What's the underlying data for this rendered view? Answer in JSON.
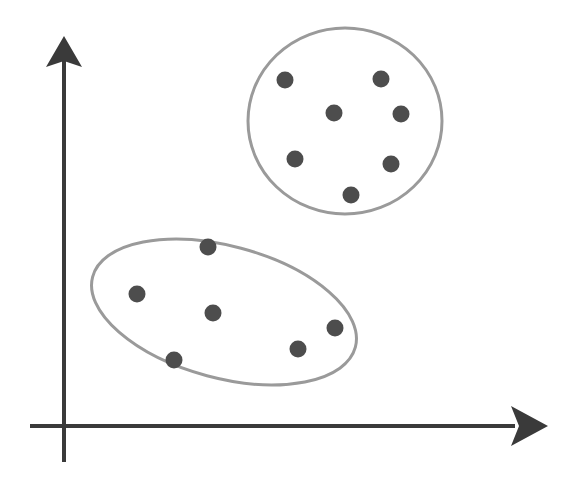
{
  "diagram": {
    "type": "clustering-illustration",
    "colors": {
      "axis": "#3a3a3a",
      "cluster_outline": "#9a9a9a",
      "point": "#4d4d4d",
      "background": "#ffffff"
    },
    "axes": {
      "origin": [
        64,
        426
      ],
      "x_end": [
        522,
        426
      ],
      "y_end": [
        64,
        36
      ]
    },
    "clusters": [
      {
        "name": "upper-right-cluster",
        "shape": "circle",
        "center": [
          345,
          121
        ],
        "rx": 97,
        "ry": 93,
        "rotation": 0,
        "points": [
          [
            285,
            80
          ],
          [
            381,
            79
          ],
          [
            334,
            113
          ],
          [
            401,
            114
          ],
          [
            295,
            159
          ],
          [
            391,
            164
          ],
          [
            351,
            195
          ]
        ]
      },
      {
        "name": "lower-left-cluster",
        "shape": "ellipse",
        "center": [
          224,
          312
        ],
        "rx": 136,
        "ry": 66,
        "rotation": 15,
        "points": [
          [
            208,
            247
          ],
          [
            137,
            294
          ],
          [
            213,
            313
          ],
          [
            335,
            328
          ],
          [
            298,
            349
          ],
          [
            174,
            360
          ]
        ]
      }
    ]
  }
}
